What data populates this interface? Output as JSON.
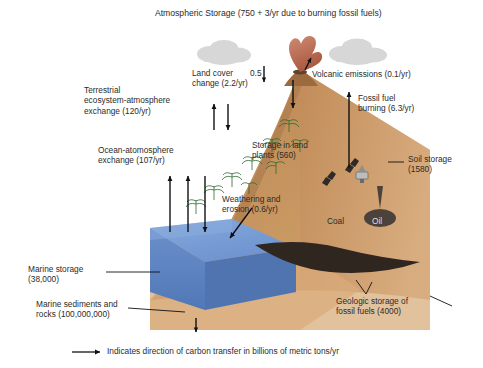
{
  "diagram": {
    "title": "Atmospheric Storage (750 + 3/yr due to burning fossil fuels)",
    "legend_text": "Indicates direction of carbon transfer in billions of metric tons/yr",
    "colors": {
      "land_light": "#e0b88d",
      "land_mid": "#c89a6b",
      "land_dark": "#a8764a",
      "soil_top": "#b98558",
      "ocean_top": "#7a9ed6",
      "ocean_front": "#5f86c4",
      "ocean_side": "#4e72ae",
      "cloud": "#d9d9d9",
      "volcano_plume": "#c0705a",
      "fossil_dark": "#3b2f2a",
      "arrow": "#1a1a1a",
      "text": "#2b2b2b",
      "background": "#ffffff"
    },
    "labels": [
      {
        "name": "terrestrial-ecosystem-exchange",
        "text": "Terrestrial\necosystem-atmosphere\nexchange (120/yr)"
      },
      {
        "name": "ocean-atmosphere-exchange",
        "text": "Ocean-atomosphere\nexchange (107/yr)"
      },
      {
        "name": "land-cover-change",
        "text": "Land cover\nchange (2.2/yr)"
      },
      {
        "name": "land-cover-change-value",
        "text": "0.5"
      },
      {
        "name": "volcanic-emissions",
        "text": "Volcanic emissions (0.1/yr)"
      },
      {
        "name": "fossil-fuel-burning",
        "text": "Fossil fuel\nburning (6.3/yr)"
      },
      {
        "name": "storage-in-land-plants",
        "text": "Storage in land\nplants (560)"
      },
      {
        "name": "soil-storage",
        "text": "Soil storage\n(1580)"
      },
      {
        "name": "weathering-and-erosion",
        "text": "Weathering and\nerosion (0.6/yr)"
      },
      {
        "name": "coal-deposit",
        "text": "Coal"
      },
      {
        "name": "oil-deposit",
        "text": "Oil"
      },
      {
        "name": "marine-storage",
        "text": "Marine storage\n(38,000)"
      },
      {
        "name": "marine-sediments-and-rocks",
        "text": "Marine sediments and\nrocks (100,000,000)"
      },
      {
        "name": "geologic-storage-fossil-fuels",
        "text": "Geologic storage of\nfossil fuels  (4000)"
      }
    ]
  }
}
